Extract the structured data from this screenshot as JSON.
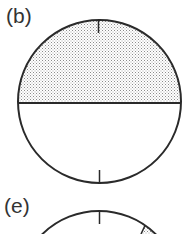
{
  "panels": [
    {
      "label": "(b)",
      "shape": "circle",
      "shading": "upper half dotted (stippled gray)",
      "divider": "horizontal diameter",
      "ticks": [
        "top",
        "bottom"
      ]
    },
    {
      "label": "(e)",
      "shape": "circle (partially visible)",
      "shading": "small dotted wedge on upper-right",
      "ticks": [
        "top"
      ]
    }
  ],
  "colors": {
    "stroke": "#2a2a2a",
    "stipple": "#9a9a9a",
    "background": "#ffffff"
  }
}
